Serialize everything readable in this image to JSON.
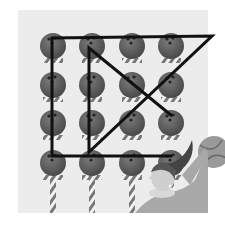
{
  "illustration": {
    "description": "Nine-dot style puzzle: 16 bowling balls on striped poles in a 4x4 grid connected by a continuous drawn line, with a cartoon girl and basketball at lower right",
    "grid": {
      "rows": 4,
      "cols": 4,
      "cols_x": [
        53,
        92,
        132,
        171
      ],
      "rows_y": [
        46,
        85,
        123,
        163
      ]
    },
    "colors": {
      "background": "#ececec",
      "ball": "#595959",
      "line": "#111111",
      "pole_light": "#f2f2f2",
      "pole_dark": "#777777"
    },
    "path_points": [
      [
        172,
        116
      ],
      [
        89,
        48
      ],
      [
        89,
        152
      ],
      [
        212,
        36
      ],
      [
        52,
        38
      ],
      [
        52,
        156
      ],
      [
        172,
        156
      ]
    ]
  }
}
